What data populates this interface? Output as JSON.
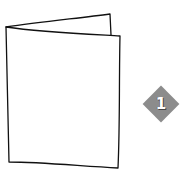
{
  "diagram": {
    "step_badge": {
      "number": "1",
      "shape": "diamond",
      "color": "#8c8c8c",
      "text_color": "#ffffff"
    },
    "stroke_color": "#111111"
  }
}
